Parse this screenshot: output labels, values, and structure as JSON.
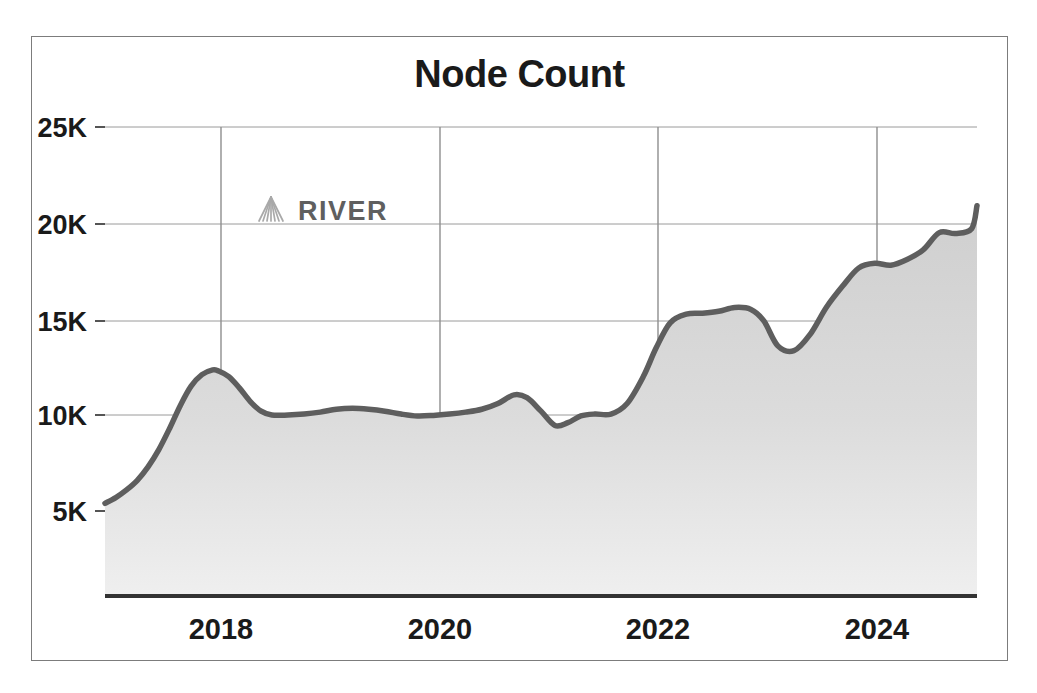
{
  "figure": {
    "background_color": "#ffffff",
    "frame_color": "#7c7c7c"
  },
  "watermark": {
    "label": "RIVER",
    "icon": "river-fan-logo-icon",
    "color": "#5f5f5f"
  },
  "chart_data": {
    "type": "area",
    "title": "Node Count",
    "xlabel": "",
    "ylabel": "",
    "grid": true,
    "legend": null,
    "line_color": "#5e5e5e",
    "fill_color": "#d4d4d4",
    "axis_color": "#333333",
    "gridline_color": "#9a9a9a",
    "xlim": [
      2017.0,
      2025.1
    ],
    "ylim": [
      0,
      26500
    ],
    "ytick_labels": [
      "25K",
      "20K",
      "15K",
      "10K",
      "5K"
    ],
    "ytick_values": [
      25000,
      20000,
      15000,
      10000,
      5000
    ],
    "xtick_labels": [
      "2018",
      "2020",
      "2022",
      "2024"
    ],
    "xtick_values": [
      2018,
      2020,
      2022,
      2024
    ],
    "x": [
      2017.0,
      2017.1,
      2017.2,
      2017.3,
      2017.4,
      2017.5,
      2017.6,
      2017.7,
      2017.8,
      2017.9,
      2018.0,
      2018.05,
      2018.15,
      2018.25,
      2018.35,
      2018.45,
      2018.55,
      2018.7,
      2018.85,
      2019.0,
      2019.15,
      2019.3,
      2019.45,
      2019.6,
      2019.75,
      2019.9,
      2020.05,
      2020.2,
      2020.35,
      2020.5,
      2020.65,
      2020.8,
      2020.92,
      2021.05,
      2021.18,
      2021.3,
      2021.42,
      2021.55,
      2021.7,
      2021.85,
      2022.0,
      2022.12,
      2022.25,
      2022.4,
      2022.55,
      2022.7,
      2022.85,
      2023.0,
      2023.12,
      2023.25,
      2023.4,
      2023.55,
      2023.7,
      2023.85,
      2024.0,
      2024.15,
      2024.3,
      2024.45,
      2024.6,
      2024.75,
      2024.9,
      2025.05
    ],
    "values": [
      5400,
      5700,
      6100,
      6600,
      7300,
      8200,
      9300,
      10500,
      11500,
      12100,
      12350,
      12300,
      12000,
      11400,
      10700,
      10200,
      10000,
      10000,
      10050,
      10150,
      10300,
      10350,
      10300,
      10200,
      10050,
      9950,
      9980,
      10050,
      10150,
      10300,
      10600,
      11050,
      10900,
      10200,
      9450,
      9600,
      9950,
      10050,
      10050,
      10600,
      12000,
      13500,
      14800,
      15250,
      15300,
      15400,
      15600,
      15500,
      14900,
      13600,
      13350,
      14200,
      15600,
      16700,
      17650,
      17900,
      17800,
      18100,
      18600,
      19500,
      19450,
      19700
    ],
    "series_end_value": 20900,
    "min_value": 5400,
    "max_value": 20900
  }
}
